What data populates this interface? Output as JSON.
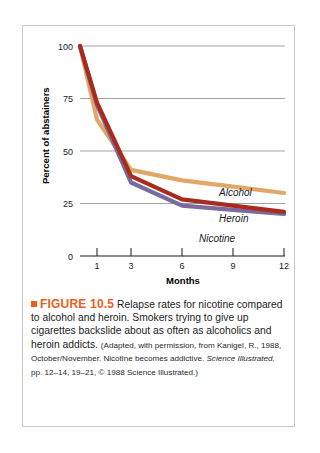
{
  "figure": {
    "marker_color": "#e8601c",
    "number_label": "FIGURE 10.5",
    "caption_lead": " Relapse rates for nicotine compared to alcohol and heroin. Smokers trying to give up cigarettes backslide about as often as alcoholics and heroin addicts.",
    "source_part1": "(Adapted, with permission, from Kanigel, R., 1988, October/November. Nicotine becomes addictive. ",
    "source_italic": "Science Illustrated,",
    "source_part2": " pp. 12–14, 19–21, © 1988 Science Illustrated.)"
  },
  "chart_data": {
    "type": "line",
    "title": "",
    "xlabel": "Months",
    "ylabel": "Percent of abstainers",
    "x": [
      0,
      1,
      3,
      6,
      9,
      12
    ],
    "xticks": [
      1,
      3,
      6,
      9,
      12
    ],
    "xtick_labels": [
      "1",
      "3",
      "6",
      "9",
      "12"
    ],
    "yticks": [
      0,
      25,
      50,
      75,
      100
    ],
    "ytick_labels": [
      "0",
      "25",
      "50",
      "75",
      "100"
    ],
    "xlim": [
      0,
      12
    ],
    "ylim": [
      0,
      100
    ],
    "grid": "horizontal",
    "legend": "inline-labels",
    "series": [
      {
        "name": "Alcohol",
        "color": "#e0a766",
        "values": [
          100,
          65,
          41,
          36,
          33,
          30
        ]
      },
      {
        "name": "Heroin",
        "color": "#a82b1e",
        "values": [
          100,
          73,
          38,
          27,
          24,
          21
        ]
      },
      {
        "name": "Nicotine",
        "color": "#7a6a9e",
        "values": [
          100,
          72,
          35,
          24,
          22,
          20
        ]
      }
    ]
  }
}
